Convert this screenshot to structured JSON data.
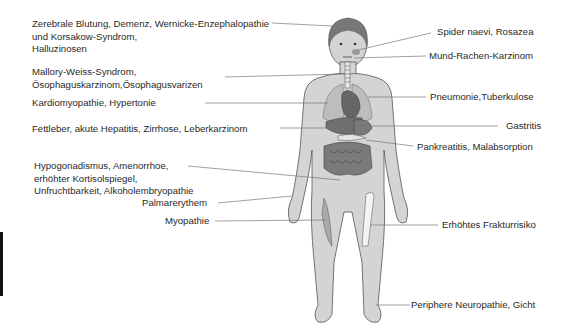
{
  "diagram": {
    "left_labels": [
      {
        "id": "brain",
        "lines": [
          "Zerebrale Blutung, Demenz, Wernicke-Enzephalopathie",
          "und Korsakow-Syndrom,",
          "Halluzinosen"
        ]
      },
      {
        "id": "esophagus",
        "lines": [
          "Mallory-Weiss-Syndrom,",
          "Ösophaguskarzinom,Ösophagusvarizen"
        ]
      },
      {
        "id": "heart",
        "lines": [
          "Kardiomyopathie, Hypertonie"
        ]
      },
      {
        "id": "liver",
        "lines": [
          "Fettleber, akute Hepatitis, Zirrhose, Leberkarzinom"
        ]
      },
      {
        "id": "reproductive",
        "lines": [
          "Hypogonadismus, Amenorrhoe,",
          "erhöhter Kortisolspiegel,",
          "Unfruchtbarkeit, Alkoholembryopathie"
        ]
      },
      {
        "id": "palm",
        "lines": [
          "Palmarerythem"
        ]
      },
      {
        "id": "muscle",
        "lines": [
          "Myopathie"
        ]
      }
    ],
    "right_labels": [
      {
        "id": "skin",
        "lines": [
          "Spider naevi, Rosazea"
        ]
      },
      {
        "id": "mouth",
        "lines": [
          "Mund-Rachen-Karzinom"
        ]
      },
      {
        "id": "lung",
        "lines": [
          "Pneumonie,Tuberkulose"
        ]
      },
      {
        "id": "stomach",
        "lines": [
          "Gastritis"
        ]
      },
      {
        "id": "pancreas",
        "lines": [
          "Pankreatitis, Malabsorption"
        ]
      },
      {
        "id": "bone",
        "lines": [
          "Erhöhtes Frakturrisiko"
        ]
      },
      {
        "id": "nerves",
        "lines": [
          "Periphere Neuropathie, Gicht"
        ]
      }
    ],
    "colors": {
      "body_fill": "#d4d4d4",
      "body_stroke": "#555555",
      "organ_fill": "#6e6e6e",
      "leader_line": "#777777",
      "text": "#2a2a2a"
    }
  }
}
